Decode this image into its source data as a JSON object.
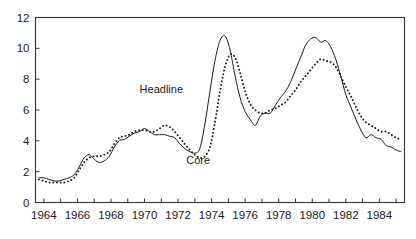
{
  "chart_data": {
    "type": "line",
    "title": "",
    "subtitle": "",
    "xlabel": "",
    "ylabel": "",
    "xlim": [
      1963.5,
      1985.5
    ],
    "ylim": [
      0,
      12
    ],
    "yticks": [
      0,
      2,
      4,
      6,
      8,
      10,
      12
    ],
    "ytick_labels": [
      "0",
      "2",
      "4",
      "6",
      "8",
      "10",
      "12"
    ],
    "xticks": [
      1964,
      1966,
      1968,
      1970,
      1972,
      1974,
      1976,
      1978,
      1980,
      1982,
      1984
    ],
    "xtick_labels": [
      "1964",
      "1966",
      "1968",
      "1970",
      "1972",
      "1974",
      "1976",
      "1978",
      "1980",
      "1982",
      "1984"
    ],
    "xminor_step": 1,
    "grid": false,
    "legend_position": "inline-annotations",
    "annotations": [
      {
        "name": "headline-label",
        "text": "Headline",
        "x": 1971.0,
        "y": 7.1
      },
      {
        "name": "core-label",
        "text": "Core",
        "x": 1973.2,
        "y": 2.5
      }
    ],
    "series": [
      {
        "name": "Headline",
        "style": "solid",
        "color": "#1a1a1a",
        "x": [
          1963.7,
          1964.0,
          1964.3,
          1964.6,
          1964.9,
          1965.2,
          1965.5,
          1965.8,
          1966.1,
          1966.4,
          1966.7,
          1967.0,
          1967.3,
          1967.6,
          1967.9,
          1968.2,
          1968.5,
          1968.8,
          1969.1,
          1969.4,
          1969.7,
          1970.0,
          1970.3,
          1970.6,
          1970.9,
          1971.2,
          1971.5,
          1971.8,
          1972.1,
          1972.4,
          1972.7,
          1973.0,
          1973.3,
          1973.6,
          1973.9,
          1974.2,
          1974.5,
          1974.8,
          1975.1,
          1975.4,
          1975.7,
          1976.0,
          1976.3,
          1976.6,
          1976.9,
          1977.2,
          1977.5,
          1977.8,
          1978.1,
          1978.4,
          1978.7,
          1979.0,
          1979.3,
          1979.6,
          1979.9,
          1980.2,
          1980.5,
          1980.8,
          1981.1,
          1981.4,
          1981.7,
          1982.0,
          1982.3,
          1982.6,
          1982.9,
          1983.2,
          1983.5,
          1983.8,
          1984.1,
          1984.4,
          1984.7,
          1985.0,
          1985.3
        ],
        "values": [
          1.6,
          1.6,
          1.5,
          1.4,
          1.4,
          1.5,
          1.6,
          1.8,
          2.3,
          2.9,
          3.1,
          2.8,
          2.6,
          2.7,
          3.0,
          3.6,
          4.0,
          4.1,
          4.3,
          4.5,
          4.6,
          4.8,
          4.6,
          4.4,
          4.4,
          4.4,
          4.3,
          4.2,
          3.8,
          3.5,
          3.3,
          3.2,
          3.5,
          5.1,
          7.2,
          9.2,
          10.5,
          10.8,
          9.9,
          8.2,
          6.8,
          5.9,
          5.4,
          5.0,
          5.6,
          5.8,
          5.8,
          6.3,
          6.8,
          7.2,
          7.8,
          8.6,
          9.4,
          10.2,
          10.6,
          10.7,
          10.4,
          10.5,
          10.1,
          9.3,
          8.2,
          7.0,
          6.2,
          5.4,
          4.7,
          4.2,
          4.4,
          4.2,
          4.1,
          3.7,
          3.6,
          3.4,
          3.3
        ]
      },
      {
        "name": "Core",
        "style": "dotted",
        "color": "#1a1a1a",
        "x": [
          1963.7,
          1964.0,
          1964.3,
          1964.6,
          1964.9,
          1965.2,
          1965.5,
          1965.8,
          1966.1,
          1966.4,
          1966.7,
          1967.0,
          1967.3,
          1967.6,
          1967.9,
          1968.2,
          1968.5,
          1968.8,
          1969.1,
          1969.4,
          1969.7,
          1970.0,
          1970.3,
          1970.6,
          1970.9,
          1971.2,
          1971.5,
          1971.8,
          1972.1,
          1972.4,
          1972.7,
          1973.0,
          1973.3,
          1973.6,
          1973.9,
          1974.2,
          1974.5,
          1974.8,
          1975.1,
          1975.4,
          1975.7,
          1976.0,
          1976.3,
          1976.6,
          1976.9,
          1977.2,
          1977.5,
          1977.8,
          1978.1,
          1978.4,
          1978.7,
          1979.0,
          1979.3,
          1979.6,
          1979.9,
          1980.2,
          1980.5,
          1980.8,
          1981.1,
          1981.4,
          1981.7,
          1982.0,
          1982.3,
          1982.6,
          1982.9,
          1983.2,
          1983.5,
          1983.8,
          1984.1,
          1984.4,
          1984.7,
          1985.0,
          1985.3
        ],
        "values": [
          1.5,
          1.4,
          1.3,
          1.3,
          1.3,
          1.3,
          1.4,
          1.6,
          2.1,
          2.6,
          2.9,
          3.0,
          3.0,
          3.1,
          3.3,
          3.8,
          4.2,
          4.3,
          4.4,
          4.6,
          4.7,
          4.7,
          4.6,
          4.6,
          4.8,
          5.0,
          4.9,
          4.6,
          4.2,
          3.8,
          3.4,
          3.1,
          2.9,
          3.0,
          3.6,
          5.2,
          7.2,
          8.8,
          9.6,
          9.4,
          8.4,
          7.2,
          6.4,
          6.0,
          5.8,
          5.8,
          6.0,
          6.1,
          6.3,
          6.5,
          6.9,
          7.3,
          7.8,
          8.2,
          8.6,
          9.0,
          9.3,
          9.2,
          9.1,
          8.8,
          8.2,
          7.5,
          6.9,
          6.2,
          5.6,
          5.2,
          5.0,
          4.8,
          4.6,
          4.6,
          4.4,
          4.2,
          4.1
        ]
      }
    ]
  },
  "figure": {
    "background": "#ffffff",
    "axis_color": "#333333",
    "text_color": "#1a1a1a"
  }
}
